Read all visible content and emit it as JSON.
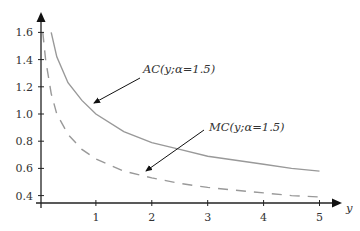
{
  "chart_data": {
    "type": "line",
    "title": "",
    "xlabel": "y",
    "ylabel": "",
    "xlim": [
      0,
      5.3
    ],
    "ylim": [
      0.35,
      1.7
    ],
    "grid": false,
    "legend": "none (curves labelled with arrow annotations)",
    "x_ticks": [
      "1",
      "2",
      "3",
      "4",
      "5"
    ],
    "y_ticks": [
      "0.4",
      "0.6",
      "0.8",
      "1.0",
      "1.2",
      "1.4",
      "1.6"
    ],
    "series": [
      {
        "name": "AC(y;α=1.5)",
        "style": "solid",
        "color": "#999999",
        "x": [
          0.2,
          0.3,
          0.5,
          0.75,
          1.0,
          1.5,
          2.0,
          2.5,
          3.0,
          3.5,
          4.0,
          4.5,
          5.0
        ],
        "y": [
          1.6,
          1.42,
          1.23,
          1.1,
          1.0,
          0.87,
          0.79,
          0.74,
          0.69,
          0.66,
          0.63,
          0.6,
          0.58
        ]
      },
      {
        "name": "MC(y;α=1.5)",
        "style": "dashed",
        "color": "#999999",
        "x": [
          0.05,
          0.1,
          0.2,
          0.3,
          0.5,
          0.75,
          1.0,
          1.5,
          2.0,
          2.5,
          3.0,
          3.5,
          4.0,
          4.5,
          5.0
        ],
        "y": [
          1.6,
          1.4,
          1.15,
          1.0,
          0.85,
          0.74,
          0.67,
          0.58,
          0.53,
          0.49,
          0.46,
          0.44,
          0.42,
          0.4,
          0.39
        ]
      }
    ],
    "annotations": [
      {
        "text": "AC(y;α=1.5)",
        "points_to": [
          1.0,
          1.0
        ]
      },
      {
        "text": "MC(y;α=1.5)",
        "points_to": [
          1.85,
          0.55
        ]
      }
    ]
  },
  "labels": {
    "x_axis": "y",
    "ac": "AC(y;α=1.5)",
    "mc": "MC(y;α=1.5)",
    "xt": [
      "1",
      "2",
      "3",
      "4",
      "5"
    ],
    "yt": [
      "0.4",
      "0.6",
      "0.8",
      "1.0",
      "1.2",
      "1.4",
      "1.6"
    ]
  }
}
